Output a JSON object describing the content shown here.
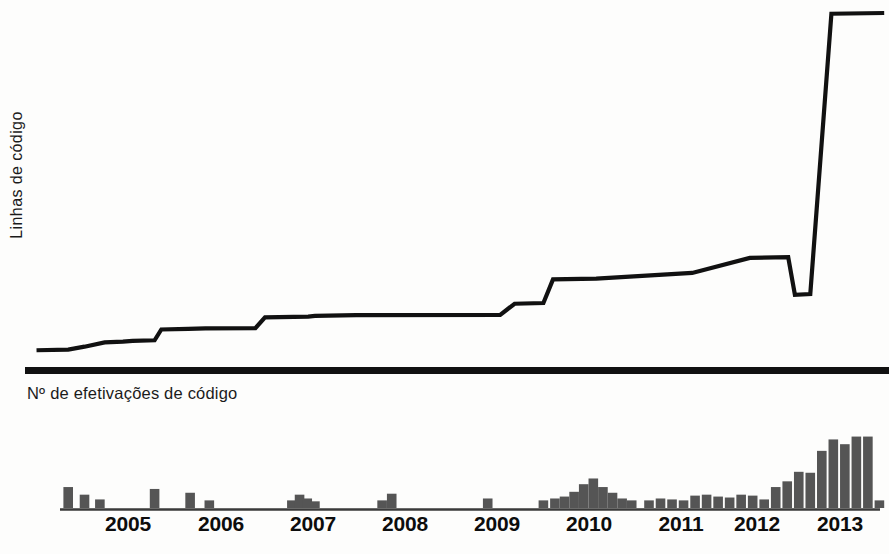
{
  "chart_data": {
    "type": "line",
    "title": "",
    "subtitle": "",
    "panels": [
      {
        "id": "lines-of-code",
        "type": "line",
        "ylabel": "Linhas de código",
        "xlabel": "",
        "grid": false,
        "legend": "none",
        "xlim": [
          2004.6,
          2013.6
        ],
        "ylim": [
          0,
          100
        ],
        "note": "Cumulative lines of code; step-wise growth then explosive rise at end of 2012.",
        "x": [
          2004.72,
          2005.05,
          2005.22,
          2005.43,
          2005.62,
          2005.72,
          2005.95,
          2006.02,
          2006.3,
          2006.48,
          2007.0,
          2007.1,
          2007.55,
          2007.62,
          2008.05,
          2009.55,
          2009.7,
          2010.0,
          2010.1,
          2010.55,
          2011.55,
          2012.15,
          2012.55,
          2012.62,
          2012.78,
          2013.0,
          2013.55
        ],
        "y": [
          3.0,
          3.2,
          4.0,
          5.2,
          5.4,
          5.6,
          5.8,
          8.8,
          9.0,
          9.1,
          9.2,
          12.2,
          12.4,
          12.6,
          12.8,
          12.9,
          16.0,
          16.2,
          22.8,
          23.0,
          24.6,
          28.8,
          29.0,
          18.5,
          18.7,
          97.0,
          97.2
        ],
        "series": [
          {
            "name": "Linhas de código",
            "color": "#111111",
            "values": [
              3.0,
              3.2,
              4.0,
              5.2,
              5.4,
              5.6,
              5.8,
              8.8,
              9.0,
              9.1,
              9.2,
              12.2,
              12.4,
              12.6,
              12.8,
              12.9,
              16.0,
              16.2,
              22.8,
              23.0,
              24.6,
              28.8,
              29.0,
              18.5,
              18.7,
              97.0,
              97.2
            ]
          }
        ]
      },
      {
        "id": "code-commits",
        "type": "bar",
        "ylabel": "Nº de efetivações de código",
        "xlabel": "",
        "grid": false,
        "legend": "none",
        "ylim": [
          0,
          105
        ],
        "bar_color": "#555555",
        "note": "Number of code commits per period; large surge during 2012-2013.",
        "categories": [
          "2005.05",
          "2005.22",
          "2005.38",
          "2005.95",
          "2006.32",
          "2006.52",
          "2007.38",
          "2007.46",
          "2007.54",
          "2007.62",
          "2008.32",
          "2008.42",
          "2009.42",
          "2010.00",
          "2010.12",
          "2010.22",
          "2010.32",
          "2010.42",
          "2010.52",
          "2010.62",
          "2010.72",
          "2010.82",
          "2010.92",
          "2011.10",
          "2011.22",
          "2011.34",
          "2011.46",
          "2011.58",
          "2011.70",
          "2011.82",
          "2011.94",
          "2012.06",
          "2012.18",
          "2012.30",
          "2012.42",
          "2012.54",
          "2012.66",
          "2012.78",
          "2012.90",
          "2013.02",
          "2013.14",
          "2013.26",
          "2013.38",
          "2013.50"
        ],
        "values": [
          22,
          14,
          9,
          20,
          16,
          8,
          8,
          14,
          10,
          7,
          8,
          15,
          10,
          8,
          10,
          12,
          17,
          25,
          31,
          22,
          16,
          10,
          8,
          8,
          10,
          9,
          8,
          13,
          14,
          12,
          11,
          14,
          13,
          9,
          22,
          28,
          38,
          37,
          60,
          72,
          67,
          75,
          75,
          8
        ]
      }
    ],
    "xtick_labels": [
      "2005",
      "2006",
      "2007",
      "2008",
      "2009",
      "2010",
      "2011",
      "2012",
      "2013"
    ],
    "xtick_positions": [
      128,
      221,
      313,
      405,
      497,
      589,
      681,
      757,
      840
    ]
  },
  "line_panel": {
    "ylabel": "Linhas de código"
  },
  "bar_panel": {
    "title": "Nº de efetivações de código"
  },
  "axis": {
    "ticks": [
      {
        "label": "2005",
        "x": 128
      },
      {
        "label": "2006",
        "x": 221
      },
      {
        "label": "2007",
        "x": 313
      },
      {
        "label": "2008",
        "x": 405
      },
      {
        "label": "2009",
        "x": 497
      },
      {
        "label": "2010",
        "x": 589
      },
      {
        "label": "2011",
        "x": 681
      },
      {
        "label": "2012",
        "x": 757
      },
      {
        "label": "2013",
        "x": 840
      }
    ]
  },
  "colors": {
    "ink": "#111111",
    "bar_fill": "#555555",
    "background": "#fdfdfc"
  }
}
